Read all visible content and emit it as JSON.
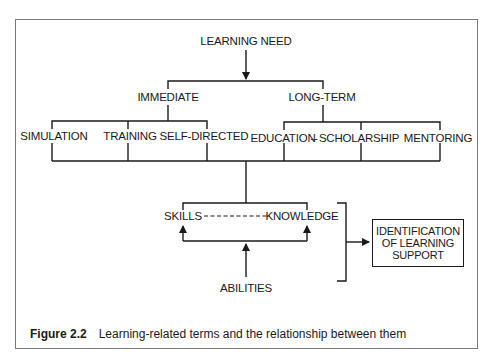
{
  "diagram": {
    "root": "LEARNING NEED",
    "branches": {
      "immediate": "IMMEDIATE",
      "long_term": "LONG-TERM"
    },
    "methods": {
      "simulation": "SIMULATION",
      "training": "TRAINING",
      "self_directed": "SELF-DIRECTED",
      "education": "EDUCATION",
      "scholarship": "SCHOLARSHIP",
      "mentoring": "MENTORING"
    },
    "education_scholarship_link": "--",
    "outcomes": {
      "skills": "SKILLS",
      "knowledge": "KNOWLEDGE",
      "abilities": "ABILITIES"
    },
    "result_box": {
      "line1": "IDENTIFICATION",
      "line2": "OF LEARNING",
      "line3": "SUPPORT"
    }
  },
  "caption": {
    "figure_number": "Figure 2.2",
    "text": "Learning-related terms and the relationship between them"
  },
  "colors": {
    "line": "#1a1a1a",
    "frame": "#7a7a7a"
  }
}
